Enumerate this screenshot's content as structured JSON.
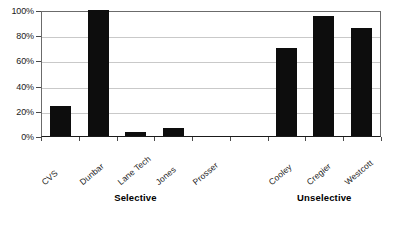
{
  "chart_data": {
    "type": "bar",
    "title": "",
    "subtitle": "",
    "xlabel": "",
    "ylabel": "",
    "categories": [
      "CVS",
      "Dunbar",
      "Lane Tech",
      "Jones",
      "Prosser",
      "Cooley",
      "Cregier",
      "Westcott"
    ],
    "values": [
      24,
      100,
      3,
      6,
      0,
      70,
      95,
      86
    ],
    "value_suffix": "%",
    "ylim": [
      0,
      100
    ],
    "ytick_labels": [
      "100%",
      "80%",
      "60%",
      "40%",
      "20%",
      "0%"
    ],
    "ytick_values": [
      100,
      80,
      60,
      40,
      20,
      0
    ],
    "grid": true,
    "grid_axis": "y",
    "legend": false,
    "legend_position": "none",
    "bar_color": "#0d0d0d",
    "grid_color": "#c9c9c9",
    "axis_color": "#4a4a4a",
    "background_color": "#ffffff",
    "groups": [
      {
        "label": "Selective",
        "categories": [
          "CVS",
          "Dunbar",
          "Lane Tech",
          "Jones",
          "Prosser"
        ]
      },
      {
        "label": "Unselective",
        "categories": [
          "Cooley",
          "Cregier",
          "Westcott"
        ]
      }
    ],
    "slots": [
      {
        "category": "CVS",
        "value": 24,
        "group": "Selective"
      },
      {
        "category": "Dunbar",
        "value": 100,
        "group": "Selective"
      },
      {
        "category": "Lane Tech",
        "value": 3,
        "group": "Selective"
      },
      {
        "category": "Jones",
        "value": 6,
        "group": "Selective"
      },
      {
        "category": "Prosser",
        "value": 0,
        "group": "Selective"
      },
      {
        "category": "",
        "value": null,
        "group": ""
      },
      {
        "category": "Cooley",
        "value": 70,
        "group": "Unselective"
      },
      {
        "category": "Cregier",
        "value": 95,
        "group": "Unselective"
      },
      {
        "category": "Westcott",
        "value": 86,
        "group": "Unselective"
      }
    ]
  }
}
